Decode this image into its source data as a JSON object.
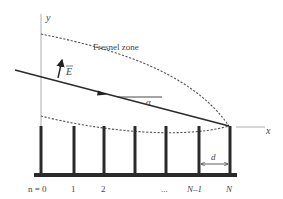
{
  "diagram": {
    "axes": {
      "y_label": "y",
      "x_label": "x"
    },
    "annotations": {
      "fresnel_zone": "Fresnel zone",
      "field_vector": "E",
      "angle": "α",
      "spacing": "d"
    },
    "post_labels": [
      "n = 0",
      "1",
      "2",
      "...",
      "N–1",
      "N"
    ],
    "colors": {
      "line": "#2a2a2a",
      "dashed": "#555555",
      "axis": "#888888",
      "text": "#444444"
    }
  }
}
